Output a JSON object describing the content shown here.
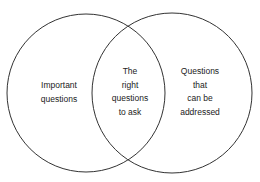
{
  "diagram": {
    "type": "venn",
    "stroke_color": "#333333",
    "sets": [
      {
        "id": "left",
        "lines": [
          "Important",
          "questions"
        ]
      },
      {
        "id": "right",
        "lines": [
          "Questions",
          "that",
          "can be",
          "addressed"
        ]
      }
    ],
    "intersection": {
      "lines": [
        "The",
        "right",
        "questions",
        "to ask"
      ]
    }
  }
}
